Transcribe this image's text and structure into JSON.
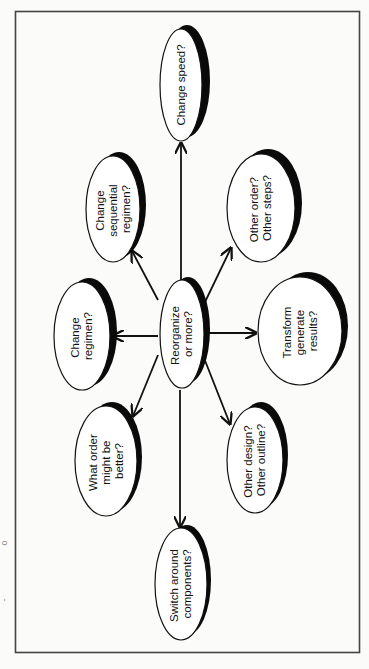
{
  "diagram": {
    "type": "mind-map",
    "orientation": "rotated-90-ccw",
    "center": {
      "id": "center",
      "lines": [
        "Reorganize",
        "or more?"
      ]
    },
    "nodes": [
      {
        "id": "change-speed",
        "lines": [
          "Change speed?"
        ]
      },
      {
        "id": "change-sequential-regimen",
        "lines": [
          "Change",
          "sequential",
          "regimen?"
        ]
      },
      {
        "id": "other-order-steps",
        "lines": [
          "Other order?",
          "Other steps?"
        ]
      },
      {
        "id": "change-regimen",
        "lines": [
          "Change",
          "regimen?"
        ]
      },
      {
        "id": "transform-generate-results",
        "lines": [
          "Transform",
          "generate",
          "results?"
        ]
      },
      {
        "id": "what-order-better",
        "lines": [
          "What order",
          "might be",
          "better?"
        ]
      },
      {
        "id": "other-design-outline",
        "lines": [
          "Other design?",
          "Other outline?"
        ]
      },
      {
        "id": "switch-around-components",
        "lines": [
          "Switch around",
          "components?"
        ]
      }
    ],
    "edges": [
      {
        "from": "center",
        "to": "change-speed"
      },
      {
        "from": "center",
        "to": "change-sequential-regimen"
      },
      {
        "from": "center",
        "to": "other-order-steps"
      },
      {
        "from": "center",
        "to": "change-regimen"
      },
      {
        "from": "center",
        "to": "transform-generate-results"
      },
      {
        "from": "center",
        "to": "what-order-better"
      },
      {
        "from": "center",
        "to": "other-design-outline"
      },
      {
        "from": "center",
        "to": "switch-around-components"
      }
    ],
    "colors": {
      "background": "#fbfbf9",
      "stroke": "#111111",
      "shadow": "#0a0a0a",
      "node_fill": "#ffffff",
      "frame": "#444444"
    }
  },
  "margin_marks": [
    "o",
    "-"
  ]
}
